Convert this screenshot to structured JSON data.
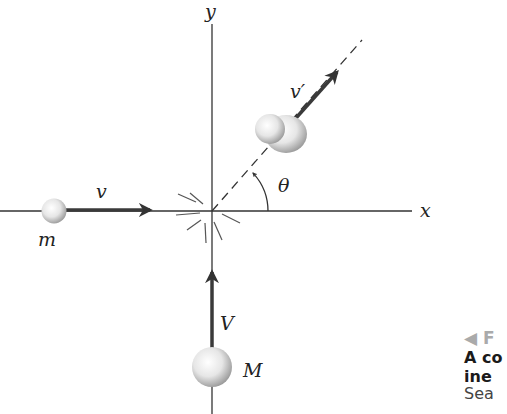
{
  "figure": {
    "axes": {
      "x_label": "x",
      "y_label": "y"
    },
    "labels": {
      "small_mass": "m",
      "small_velocity": "v",
      "large_mass": "M",
      "large_velocity": "V",
      "final_velocity": "v′",
      "angle": "θ"
    },
    "colors": {
      "line": "#333333",
      "arrow": "#3a3a3a",
      "sphere_light": "#ffffff",
      "sphere_dark": "#9a9a9a"
    }
  },
  "caption": {
    "tag": "◀ F",
    "line1": "A co",
    "line2": "ine",
    "line3": "Sea"
  }
}
